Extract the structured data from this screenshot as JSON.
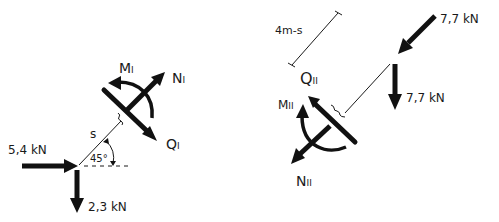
{
  "diagram": {
    "type": "free-body-diagram",
    "style": "hand-drawn",
    "ink_color": "#111111",
    "background": "#ffffff",
    "left_part": {
      "name": "Part I",
      "loads": [
        {
          "label": "5,4 kN",
          "direction": "right"
        },
        {
          "label": "2,3 kN",
          "direction": "down"
        }
      ],
      "member_length_label": "s",
      "angle_label": "45°",
      "internal_forces": {
        "moment": {
          "symbol": "M",
          "subscript": "I"
        },
        "normal": {
          "symbol": "N",
          "subscript": "I"
        },
        "shear": {
          "symbol": "Q",
          "subscript": "I"
        }
      }
    },
    "right_part": {
      "name": "Part II",
      "dimension_label": "4m-s",
      "loads": [
        {
          "label": "7,7 kN",
          "direction": "down-left diagonal"
        },
        {
          "label": "7,7 kN",
          "direction": "down"
        }
      ],
      "internal_forces": {
        "shear": {
          "symbol": "Q",
          "subscript": "II"
        },
        "moment": {
          "symbol": "M",
          "subscript": "II"
        },
        "normal": {
          "symbol": "N",
          "subscript": "II"
        }
      }
    }
  }
}
